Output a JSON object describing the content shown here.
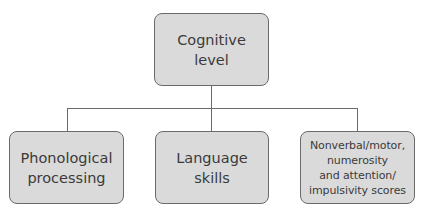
{
  "diagram": {
    "type": "hierarchy",
    "colors": {
      "box_fill": "#dadada",
      "box_border": "#6a6a6a",
      "connector": "#6a6a6a",
      "text": "#3a3a3a",
      "background": "#ffffff"
    },
    "root": {
      "label": "Cognitive\nlevel"
    },
    "children": [
      {
        "label": "Phonological\nprocessing"
      },
      {
        "label": "Language\nskills"
      },
      {
        "label": "Nonverbal/motor,\nnumerosity\nand attention/\nimpulsivity scores"
      }
    ],
    "edges": [
      {
        "from": "Cognitive level",
        "to": "Phonological processing"
      },
      {
        "from": "Cognitive level",
        "to": "Language skills"
      },
      {
        "from": "Cognitive level",
        "to": "Nonverbal/motor, numerosity and attention/impulsivity scores"
      }
    ]
  }
}
